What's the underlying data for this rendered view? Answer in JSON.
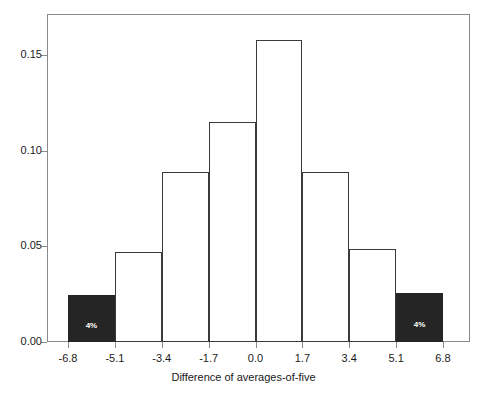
{
  "chart_data": {
    "type": "bar",
    "title": "",
    "subtitle": "",
    "xlabel": "Difference of averages-of-five",
    "ylabel": "",
    "grid": false,
    "legend": null,
    "xlim": [
      -8.5,
      8.5
    ],
    "ylim": [
      0.0,
      0.172
    ],
    "xtick_labels": [
      "-6.8",
      "-5.1",
      "-3.4",
      "-1.7",
      "0.0",
      "1.7",
      "3.4",
      "5.1",
      "6.8"
    ],
    "xtick_values": [
      -6.8,
      -5.1,
      -3.4,
      -1.7,
      0.0,
      1.7,
      3.4,
      5.1,
      6.8
    ],
    "ytick_labels": [
      "0.00",
      "0.05",
      "0.10",
      "0.15"
    ],
    "ytick_values": [
      0.0,
      0.05,
      0.1,
      0.15
    ],
    "bin_edges": [
      -6.8,
      -5.1,
      -3.4,
      -1.7,
      0.0,
      1.7,
      3.4,
      5.1,
      6.8
    ],
    "categories": [
      "-6.8 to -5.1",
      "-5.1 to -3.4",
      "-3.4 to -1.7",
      "-1.7 to 0.0",
      "0.0 to 1.7",
      "1.7 to 3.4",
      "3.4 to 5.1",
      "5.1 to 6.8"
    ],
    "values": [
      0.0245,
      0.047,
      0.089,
      0.115,
      0.158,
      0.089,
      0.0485,
      0.0255
    ],
    "bars": [
      {
        "index": 0,
        "value": 0.0245,
        "filled": true,
        "annotation": "4%"
      },
      {
        "index": 1,
        "value": 0.047,
        "filled": false,
        "annotation": ""
      },
      {
        "index": 2,
        "value": 0.089,
        "filled": false,
        "annotation": ""
      },
      {
        "index": 3,
        "value": 0.115,
        "filled": false,
        "annotation": ""
      },
      {
        "index": 4,
        "value": 0.158,
        "filled": false,
        "annotation": ""
      },
      {
        "index": 5,
        "value": 0.089,
        "filled": false,
        "annotation": ""
      },
      {
        "index": 6,
        "value": 0.0485,
        "filled": false,
        "annotation": ""
      },
      {
        "index": 7,
        "value": 0.0255,
        "filled": true,
        "annotation": "4%"
      }
    ],
    "annotations": [
      {
        "text": "4%",
        "bar_index": 0
      },
      {
        "text": "4%",
        "bar_index": 7
      }
    ],
    "colors": {
      "bar_fill": "#ffffff",
      "bar_outline": "#3b3b3b",
      "bar_highlight_fill": "#252525",
      "annotation_text": "#ffffff",
      "axis": "#8a8a8a",
      "text": "#1a1a1a",
      "background": "#ffffff"
    }
  }
}
